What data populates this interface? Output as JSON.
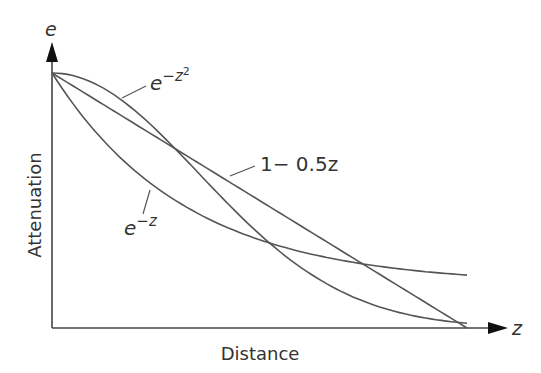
{
  "chart_data": {
    "type": "line",
    "title": "",
    "xlabel": "Distance",
    "ylabel": "Attenuation",
    "x_axis_symbol": "z",
    "y_axis_symbol": "e",
    "xlim": [
      0,
      2
    ],
    "ylim": [
      0,
      1
    ],
    "grid": false,
    "legend": "inline labels",
    "series": [
      {
        "name": "e^{-z^2}",
        "label_base": "e",
        "label_exp": "−z",
        "label_exp2": "2",
        "formula": "exp(-z*z)",
        "x": [
          0,
          0.25,
          0.5,
          0.75,
          1.0,
          1.25,
          1.5,
          1.75,
          2.0
        ],
        "values": [
          1.0,
          0.939,
          0.779,
          0.57,
          0.368,
          0.21,
          0.105,
          0.047,
          0.018
        ]
      },
      {
        "name": "1 - 0.5z",
        "label": "1− 0.5z",
        "formula": "1-0.5*z",
        "x": [
          0,
          0.5,
          1.0,
          1.5,
          2.0
        ],
        "values": [
          1.0,
          0.75,
          0.5,
          0.25,
          0.0
        ]
      },
      {
        "name": "e^{-z}",
        "label_base": "e",
        "label_exp": "−z",
        "formula": "exp(-z)",
        "x": [
          0,
          0.25,
          0.5,
          0.75,
          1.0,
          1.25,
          1.5,
          1.75,
          2.0
        ],
        "values": [
          1.0,
          0.779,
          0.607,
          0.472,
          0.368,
          0.287,
          0.223,
          0.174,
          0.18
        ]
      }
    ]
  },
  "colors": {
    "line": "#555555",
    "axis": "#444444",
    "text": "#333333"
  }
}
